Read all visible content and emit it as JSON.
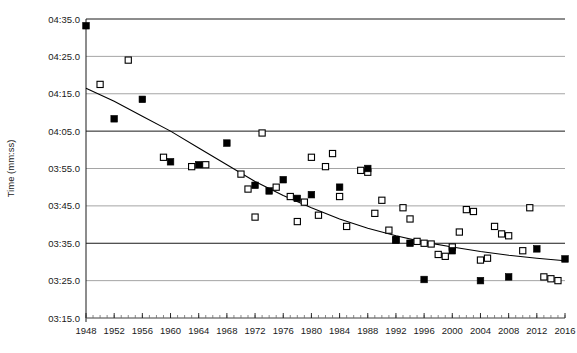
{
  "chart_data": {
    "type": "scatter",
    "title": "",
    "xlabel": "",
    "ylabel": "Time (mm:ss)",
    "grid": true,
    "legend_position": "none",
    "xlim": [
      1948,
      2016
    ],
    "ylim_seconds": [
      195,
      275
    ],
    "ylim_labels": [
      "03:15.0",
      "04:35.0"
    ],
    "x_ticks": [
      1948,
      1952,
      1956,
      1960,
      1964,
      1968,
      1972,
      1976,
      1980,
      1984,
      1988,
      1992,
      1996,
      2000,
      2004,
      2008,
      2012,
      2016
    ],
    "x_minor_tick_interval": 1,
    "y_ticks_labels": [
      "03:15.0",
      "03:25.0",
      "03:35.0",
      "03:45.0",
      "03:55.0",
      "04:05.0",
      "04:15.0",
      "04:25.0",
      "04:35.0"
    ],
    "y_ticks_seconds": [
      195,
      205,
      215,
      225,
      235,
      245,
      255,
      265,
      275
    ],
    "series": [
      {
        "name": "filled-squares",
        "marker": "filled-square",
        "color": "#000000",
        "points": [
          {
            "x": 1948,
            "y": 273.2
          },
          {
            "x": 1952,
            "y": 248.3
          },
          {
            "x": 1956,
            "y": 253.5
          },
          {
            "x": 1960,
            "y": 236.8
          },
          {
            "x": 1964,
            "y": 236.0
          },
          {
            "x": 1968,
            "y": 241.8
          },
          {
            "x": 1972,
            "y": 230.5
          },
          {
            "x": 1974,
            "y": 229.0
          },
          {
            "x": 1976,
            "y": 232.0
          },
          {
            "x": 1978,
            "y": 227.0
          },
          {
            "x": 1980,
            "y": 228.0
          },
          {
            "x": 1984,
            "y": 230.0
          },
          {
            "x": 1988,
            "y": 235.0
          },
          {
            "x": 1992,
            "y": 215.8
          },
          {
            "x": 1994,
            "y": 215.0
          },
          {
            "x": 1996,
            "y": 205.3
          },
          {
            "x": 2000,
            "y": 213.0
          },
          {
            "x": 2004,
            "y": 205.0
          },
          {
            "x": 2008,
            "y": 206.0
          },
          {
            "x": 2012,
            "y": 213.5
          },
          {
            "x": 2016,
            "y": 210.8
          }
        ]
      },
      {
        "name": "open-squares",
        "marker": "open-square",
        "color": "#000000",
        "points": [
          {
            "x": 1950,
            "y": 257.5
          },
          {
            "x": 1954,
            "y": 264.0
          },
          {
            "x": 1959,
            "y": 238.0
          },
          {
            "x": 1963,
            "y": 235.5
          },
          {
            "x": 1965,
            "y": 236.0
          },
          {
            "x": 1970,
            "y": 233.5
          },
          {
            "x": 1971,
            "y": 229.5
          },
          {
            "x": 1972,
            "y": 222.0
          },
          {
            "x": 1973,
            "y": 244.5
          },
          {
            "x": 1975,
            "y": 230.0
          },
          {
            "x": 1977,
            "y": 227.5
          },
          {
            "x": 1978,
            "y": 220.8
          },
          {
            "x": 1979,
            "y": 226.0
          },
          {
            "x": 1980,
            "y": 238.0
          },
          {
            "x": 1981,
            "y": 222.5
          },
          {
            "x": 1982,
            "y": 235.5
          },
          {
            "x": 1983,
            "y": 239.0
          },
          {
            "x": 1984,
            "y": 227.5
          },
          {
            "x": 1985,
            "y": 219.5
          },
          {
            "x": 1987,
            "y": 234.5
          },
          {
            "x": 1988,
            "y": 234.0
          },
          {
            "x": 1989,
            "y": 223.0
          },
          {
            "x": 1990,
            "y": 226.5
          },
          {
            "x": 1991,
            "y": 218.5
          },
          {
            "x": 1992,
            "y": 216.0
          },
          {
            "x": 1993,
            "y": 224.5
          },
          {
            "x": 1994,
            "y": 221.5
          },
          {
            "x": 1995,
            "y": 215.5
          },
          {
            "x": 1996,
            "y": 215.0
          },
          {
            "x": 1997,
            "y": 214.8
          },
          {
            "x": 1998,
            "y": 212.0
          },
          {
            "x": 1999,
            "y": 211.5
          },
          {
            "x": 2000,
            "y": 214.0
          },
          {
            "x": 2001,
            "y": 218.0
          },
          {
            "x": 2002,
            "y": 224.0
          },
          {
            "x": 2003,
            "y": 223.5
          },
          {
            "x": 2004,
            "y": 210.5
          },
          {
            "x": 2005,
            "y": 211.0
          },
          {
            "x": 2006,
            "y": 219.5
          },
          {
            "x": 2007,
            "y": 217.5
          },
          {
            "x": 2008,
            "y": 217.0
          },
          {
            "x": 2010,
            "y": 213.0
          },
          {
            "x": 2011,
            "y": 224.5
          },
          {
            "x": 2013,
            "y": 206.0
          },
          {
            "x": 2014,
            "y": 205.5
          },
          {
            "x": 2015,
            "y": 205.0
          }
        ]
      }
    ],
    "trend_line": {
      "name": "fitted-trend-curve",
      "color": "#000000",
      "points": [
        {
          "x": 1948,
          "y": 256.5
        },
        {
          "x": 1952,
          "y": 253.0
        },
        {
          "x": 1956,
          "y": 249.0
        },
        {
          "x": 1960,
          "y": 245.0
        },
        {
          "x": 1964,
          "y": 240.5
        },
        {
          "x": 1968,
          "y": 236.0
        },
        {
          "x": 1972,
          "y": 231.5
        },
        {
          "x": 1976,
          "y": 227.8
        },
        {
          "x": 1980,
          "y": 224.5
        },
        {
          "x": 1984,
          "y": 221.5
        },
        {
          "x": 1988,
          "y": 219.0
        },
        {
          "x": 1992,
          "y": 217.0
        },
        {
          "x": 1996,
          "y": 215.3
        },
        {
          "x": 2000,
          "y": 214.0
        },
        {
          "x": 2004,
          "y": 212.8
        },
        {
          "x": 2008,
          "y": 211.8
        },
        {
          "x": 2012,
          "y": 211.0
        },
        {
          "x": 2016,
          "y": 210.3
        }
      ]
    }
  }
}
